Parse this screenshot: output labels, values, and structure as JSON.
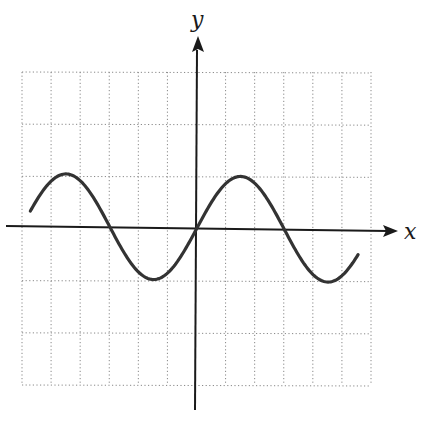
{
  "chart_data": {
    "type": "line",
    "title": "",
    "xlabel": "x",
    "ylabel": "y",
    "function": "y = sin(x)",
    "grid": true,
    "grid_style": "dotted",
    "grid_columns": 12,
    "grid_rows": 6,
    "x_unit_per_column": "π/3",
    "y_unit_per_row": 1,
    "xlim": [
      -6.28,
      6.0
    ],
    "ylim": [
      -3,
      3
    ],
    "series": [
      {
        "name": "sine curve",
        "x_start": -6.0,
        "x_end": 5.8,
        "amplitude": 1,
        "period": 6.283,
        "key_points": [
          {
            "x": -4.712,
            "y": 1,
            "label": "max"
          },
          {
            "x": -3.1416,
            "y": 0,
            "label": "x-intercept"
          },
          {
            "x": -1.571,
            "y": -1,
            "label": "min"
          },
          {
            "x": 0,
            "y": 0,
            "label": "origin"
          },
          {
            "x": 1.571,
            "y": 1,
            "label": "max"
          },
          {
            "x": 3.1416,
            "y": 0,
            "label": "x-intercept"
          },
          {
            "x": 4.712,
            "y": -1,
            "label": "min"
          }
        ]
      }
    ],
    "colors": {
      "curve": "#333333",
      "axes": "#1a1a1a",
      "grid": "#888888"
    }
  },
  "labels": {
    "x_axis": "x",
    "y_axis": "y"
  }
}
